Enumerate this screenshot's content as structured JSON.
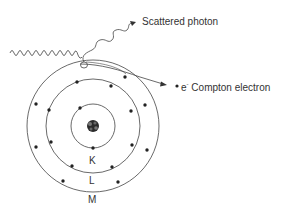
{
  "diagram": {
    "type": "compton-scattering-atom",
    "labels": {
      "scattered_photon": "Scattered photon",
      "electron_symbol": "e",
      "electron_charge": "-",
      "compton_electron": "Compton electron"
    },
    "shells": [
      {
        "name": "K",
        "radius": 22
      },
      {
        "name": "L",
        "radius": 47
      },
      {
        "name": "M",
        "radius": 66
      }
    ],
    "nucleus": {
      "cx": 93,
      "cy": 126
    },
    "colors": {
      "line": "#444444",
      "electron": "#222222",
      "text": "#333333"
    }
  }
}
